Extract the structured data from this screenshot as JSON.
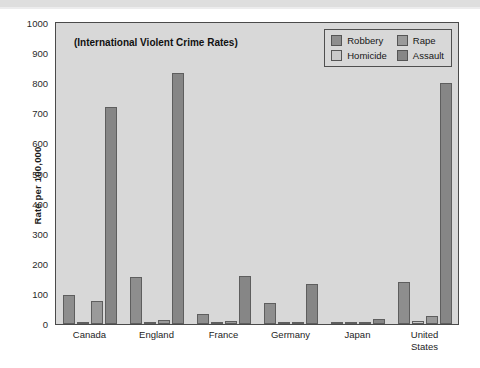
{
  "chart_data": {
    "type": "bar",
    "title": "(International Violent Crime Rates)",
    "xlabel": "",
    "ylabel": "Rate per 100,000",
    "ylim": [
      0,
      1000
    ],
    "yticks": [
      0,
      100,
      200,
      300,
      400,
      500,
      600,
      700,
      800,
      900,
      1000
    ],
    "ytick_labels": [
      "0",
      "100",
      "200",
      "300",
      "400",
      "500",
      "600",
      "700",
      "800",
      "900",
      "1000"
    ],
    "grid": false,
    "legend_position": "top-right",
    "categories": [
      "Canada",
      "England",
      "France",
      "Germany",
      "Japan",
      "United\nStates"
    ],
    "series": [
      {
        "name": "Robbery",
        "color": "#8e8e8e",
        "values": [
          95,
          157,
          32,
          70,
          2,
          141
        ]
      },
      {
        "name": "Homicide",
        "color": "#c9c9c9",
        "values": [
          2,
          1,
          1,
          1,
          1,
          9
        ]
      },
      {
        "name": "Rape",
        "color": "#9a9a9a",
        "values": [
          78,
          14,
          11,
          6,
          2,
          27
        ]
      },
      {
        "name": "Assault",
        "color": "#868686",
        "values": [
          722,
          833,
          158,
          133,
          18,
          800
        ]
      }
    ]
  },
  "legend": {
    "entries": [
      {
        "label": "Robbery",
        "swatch": "#8e8e8e"
      },
      {
        "label": "Rape",
        "swatch": "#9a9a9a"
      },
      {
        "label": "Homicide",
        "swatch": "#c9c9c9"
      },
      {
        "label": "Assault",
        "swatch": "#868686"
      }
    ]
  },
  "colors": {
    "plot_background": "#d8d8d8",
    "page_background": "#ffffff",
    "axis": "#4a4a4a",
    "text": "#1b1b1b"
  }
}
